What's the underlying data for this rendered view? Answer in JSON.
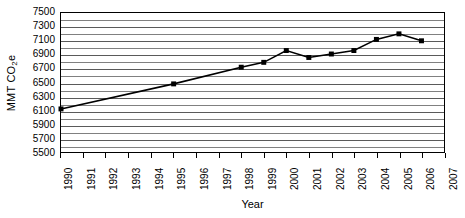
{
  "chart_data": {
    "type": "line",
    "title": "",
    "xlabel": "Year",
    "ylabel": "MMT CO2e",
    "ylabel_prefix": "MMT CO",
    "ylabel_sub": "2",
    "ylabel_suffix": "e",
    "xlim": [
      1990,
      2007
    ],
    "ylim": [
      5500,
      7500
    ],
    "y_major_step": 200,
    "y_minor_step": 100,
    "grid": true,
    "legend": "none",
    "marker": "square",
    "line_color": "#000000",
    "marker_color": "#000000",
    "grid_color": "#808080",
    "axis_color": "#000000",
    "y_ticks": [
      5500,
      5700,
      5900,
      6100,
      6300,
      6500,
      6700,
      6900,
      7100,
      7300,
      7500
    ],
    "y_minor_ticks": [
      5600,
      5800,
      6000,
      6200,
      6400,
      6600,
      6800,
      7000,
      7200,
      7400
    ],
    "x_ticks": [
      1990,
      1991,
      1992,
      1993,
      1994,
      1995,
      1996,
      1997,
      1998,
      1999,
      2000,
      2001,
      2002,
      2003,
      2004,
      2005,
      2006,
      2007
    ],
    "x": [
      1990,
      1995,
      1998,
      1999,
      2000,
      2001,
      2002,
      2003,
      2004,
      2005,
      2006
    ],
    "values": [
      6120,
      6480,
      6720,
      6790,
      6960,
      6860,
      6910,
      6960,
      7120,
      7200,
      7100
    ],
    "series": [
      {
        "name": "MMT CO2e",
        "points": [
          {
            "x": 1990,
            "y": 6120
          },
          {
            "x": 1995,
            "y": 6480
          },
          {
            "x": 1998,
            "y": 6720
          },
          {
            "x": 1999,
            "y": 6790
          },
          {
            "x": 2000,
            "y": 6960
          },
          {
            "x": 2001,
            "y": 6860
          },
          {
            "x": 2002,
            "y": 6910
          },
          {
            "x": 2003,
            "y": 6960
          },
          {
            "x": 2004,
            "y": 7120
          },
          {
            "x": 2005,
            "y": 7200
          },
          {
            "x": 2006,
            "y": 7100
          }
        ]
      }
    ]
  }
}
